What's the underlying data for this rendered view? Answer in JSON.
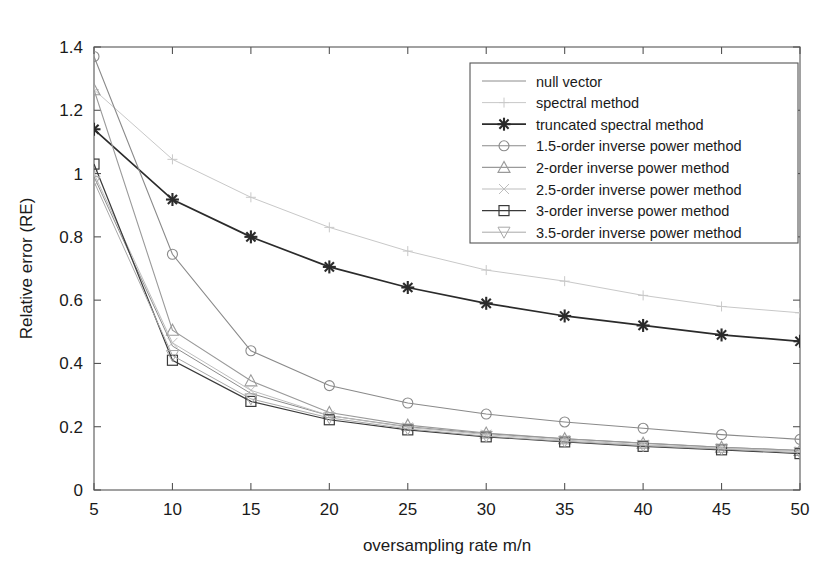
{
  "chart_data": {
    "type": "line",
    "title": "",
    "xlabel": "oversampling rate m/n",
    "ylabel": "Relative error (RE)",
    "x": [
      5,
      10,
      15,
      20,
      25,
      30,
      35,
      40,
      45,
      50
    ],
    "xlim": [
      5,
      50
    ],
    "ylim": [
      0,
      1.4
    ],
    "xticks": [
      5,
      10,
      15,
      20,
      25,
      30,
      35,
      40,
      45,
      50
    ],
    "yticks": [
      0,
      0.2,
      0.4,
      0.6,
      0.8,
      1,
      1.2,
      1.4
    ],
    "xtick_labels": [
      "5",
      "10",
      "15",
      "20",
      "25",
      "30",
      "35",
      "40",
      "45",
      "50"
    ],
    "ytick_labels": [
      "0",
      "0.2",
      "0.4",
      "0.6",
      "0.8",
      "1",
      "1.2",
      "1.4"
    ],
    "grid": false,
    "legend_position": "upper right",
    "series": [
      {
        "name": "null vector",
        "marker": "none",
        "color": "#8c8c8c",
        "width": 1.0,
        "values": [
          0.99,
          0.455,
          0.305,
          0.235,
          0.2,
          0.178,
          0.162,
          0.148,
          0.135,
          0.125
        ]
      },
      {
        "name": "spectral method",
        "marker": "plus",
        "color": "#c8c8c8",
        "width": 1.0,
        "values": [
          1.265,
          1.045,
          0.925,
          0.83,
          0.755,
          0.695,
          0.66,
          0.615,
          0.58,
          0.56
        ]
      },
      {
        "name": "truncated spectral method",
        "marker": "asterisk",
        "color": "#2b2b2b",
        "width": 1.7,
        "values": [
          1.14,
          0.918,
          0.8,
          0.705,
          0.64,
          0.59,
          0.55,
          0.52,
          0.49,
          0.47
        ]
      },
      {
        "name": "1.5-order inverse power method",
        "marker": "circle",
        "color": "#8a8a8a",
        "width": 1.1,
        "values": [
          1.37,
          0.745,
          0.44,
          0.33,
          0.275,
          0.24,
          0.215,
          0.195,
          0.175,
          0.16
        ]
      },
      {
        "name": "2-order inverse power method",
        "marker": "triangle-up",
        "color": "#9a9a9a",
        "width": 1.1,
        "values": [
          1.265,
          0.505,
          0.345,
          0.245,
          0.205,
          0.18,
          0.162,
          0.148,
          0.135,
          0.125
        ]
      },
      {
        "name": "2.5-order inverse power method",
        "marker": "cross",
        "color": "#bdbdbd",
        "width": 1.0,
        "values": [
          1.0,
          0.465,
          0.315,
          0.235,
          0.198,
          0.175,
          0.158,
          0.143,
          0.132,
          0.122
        ]
      },
      {
        "name": "3-order inverse power method",
        "marker": "square",
        "color": "#3a3a3a",
        "width": 1.2,
        "values": [
          1.03,
          0.41,
          0.28,
          0.222,
          0.19,
          0.168,
          0.152,
          0.138,
          0.127,
          0.115
        ]
      },
      {
        "name": "3.5-order inverse power method",
        "marker": "triangle-down",
        "color": "#a8a8a8",
        "width": 1.0,
        "values": [
          0.975,
          0.425,
          0.288,
          0.228,
          0.193,
          0.17,
          0.154,
          0.14,
          0.129,
          0.118
        ]
      }
    ]
  }
}
